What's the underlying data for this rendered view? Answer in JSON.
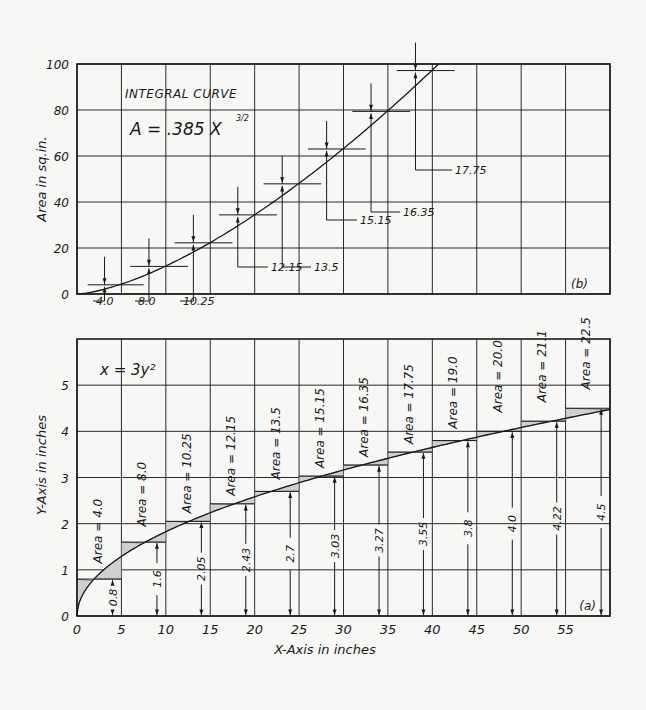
{
  "chart_data": [
    {
      "id": "b",
      "type": "line",
      "title": "INTEGRAL CURVE",
      "equation": "A = .385 X^(3/2)",
      "panel_label": "(b)",
      "ylabel": "Area in sq.in.",
      "xlabel": "",
      "ylim": [
        0,
        100
      ],
      "xlim": [
        0,
        60
      ],
      "yticks": [
        "0",
        "20",
        "40",
        "60",
        "80",
        "100"
      ],
      "grid": true,
      "curve": {
        "name": "A = .385 X^1.5",
        "coef": 0.385,
        "exponent": 1.5
      },
      "step_labels": [
        "4.0",
        "8.0",
        "10.25",
        "12.15",
        "13.5",
        "15.15",
        "16.35",
        "17.75"
      ],
      "step_cumulative": [
        4.0,
        12.0,
        22.25,
        34.4,
        47.9,
        63.05,
        79.4,
        97.15
      ]
    },
    {
      "id": "a",
      "type": "line",
      "title": "x = 3y²",
      "panel_label": "(a)",
      "xlabel": "X-Axis in inches",
      "ylabel": "Y-Axis in inches",
      "xlim": [
        0,
        60
      ],
      "ylim": [
        0,
        6
      ],
      "xticks": [
        "0",
        "5",
        "10",
        "15",
        "20",
        "25",
        "30",
        "35",
        "40",
        "45",
        "50",
        "55"
      ],
      "yticks": [
        "0",
        "1",
        "2",
        "3",
        "4",
        "5"
      ],
      "grid": true,
      "strips": [
        {
          "x0": 0,
          "x1": 5,
          "height": 0.8,
          "height_label": "0.8",
          "area_label": "Area = 4.0"
        },
        {
          "x0": 5,
          "x1": 10,
          "height": 1.6,
          "height_label": "1.6",
          "area_label": "Area = 8.0"
        },
        {
          "x0": 10,
          "x1": 15,
          "height": 2.05,
          "height_label": "2.05",
          "area_label": "Area = 10.25"
        },
        {
          "x0": 15,
          "x1": 20,
          "height": 2.43,
          "height_label": "2.43",
          "area_label": "Area = 12.15"
        },
        {
          "x0": 20,
          "x1": 25,
          "height": 2.7,
          "height_label": "2.7",
          "area_label": "Area = 13.5"
        },
        {
          "x0": 25,
          "x1": 30,
          "height": 3.03,
          "height_label": "3.03",
          "area_label": "Area = 15.15"
        },
        {
          "x0": 30,
          "x1": 35,
          "height": 3.27,
          "height_label": "3.27",
          "area_label": "Area = 16.35"
        },
        {
          "x0": 35,
          "x1": 40,
          "height": 3.55,
          "height_label": "3.55",
          "area_label": "Area = 17.75"
        },
        {
          "x0": 40,
          "x1": 45,
          "height": 3.8,
          "height_label": "3.8",
          "area_label": "Area = 19.0"
        },
        {
          "x0": 45,
          "x1": 50,
          "height": 4.0,
          "height_label": "4.0",
          "area_label": "Area = 20.0"
        },
        {
          "x0": 50,
          "x1": 55,
          "height": 4.22,
          "height_label": "4.22",
          "area_label": "Area = 21.1"
        },
        {
          "x0": 55,
          "x1": 60,
          "height": 4.5,
          "height_label": "4.5",
          "area_label": "Area = 22.5"
        }
      ]
    }
  ]
}
